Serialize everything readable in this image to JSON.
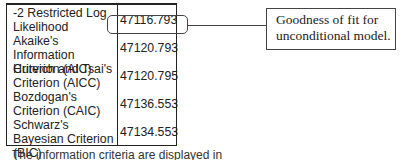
{
  "table": {
    "rows": [
      {
        "label": "-2 Restricted Log Likelihood",
        "value": "47116.793"
      },
      {
        "label": "Akaike's Information Criterion (AIC)",
        "value": "47120.793"
      },
      {
        "label": "Hurvich and Tsai's Criterion (AICC)",
        "value": "47120.795"
      },
      {
        "label": "Bozdogan's Criterion (CAIC)",
        "value": "47136.553"
      },
      {
        "label": "Schwarz's Bayesian Criterion (BIC)",
        "value": "47134.553"
      }
    ]
  },
  "annotation": {
    "text": "Goodness of fit for unconditional model."
  },
  "caption": "The information criteria are displayed in"
}
